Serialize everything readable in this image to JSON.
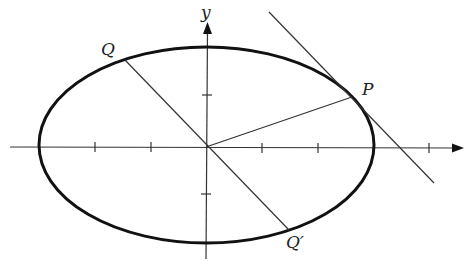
{
  "diagram": {
    "type": "ellipse-conjugate-diameters",
    "axes": {
      "x_label": "",
      "y_label": "y"
    },
    "points": {
      "P": "P",
      "Q": "Q",
      "Q_prime": "Q′"
    },
    "colors": {
      "stroke": "#1a1a1a",
      "background": "#ffffff"
    }
  }
}
